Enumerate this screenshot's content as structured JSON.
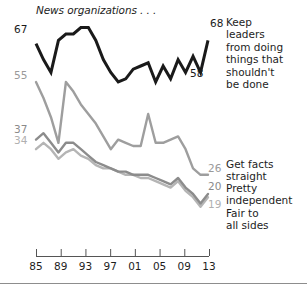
{
  "title": "News organizations . . .",
  "colors": {
    "keep_leaders": "#1a1a1a",
    "get_facts_straight": "#9e9e9e",
    "pretty_independent": "#8c8c8c",
    "fair_to_all_sides": "#b5b5b5",
    "axis": "#555555",
    "rule": "#8d8d8d",
    "background": "#ffffff"
  },
  "left_labels": [
    {
      "text": "67",
      "tone": "black"
    },
    {
      "text": "55",
      "tone": "mid"
    },
    {
      "text": "37",
      "tone": "dark"
    },
    {
      "text": "34",
      "tone": "light"
    }
  ],
  "inline_labels": [
    {
      "text": "68",
      "tone": "black"
    },
    {
      "text": "58",
      "tone": "black"
    },
    {
      "text": "26",
      "tone": "mid"
    },
    {
      "text": "20",
      "tone": "dark"
    },
    {
      "text": "19",
      "tone": "light"
    }
  ],
  "captions": {
    "keep_leaders": "Keep\nleaders\nfrom doing\nthings that\nshouldn't\nbe done",
    "get_facts_straight": "Get facts\nstraight",
    "pretty_independent": "Pretty\nindependent",
    "fair_to_all_sides": "Fair to\nall sides"
  },
  "axis": {
    "ticks": [
      "85",
      "89",
      "93",
      "97",
      "01",
      "05",
      "09",
      "13"
    ]
  },
  "chart_data": {
    "type": "line",
    "title": "News organizations . . .",
    "xlabel": "",
    "ylabel": "",
    "xlim": [
      1985,
      2013
    ],
    "ylim": [
      15,
      75
    ],
    "grid": false,
    "legend": "right-inline",
    "x": [
      1985,
      1986,
      1987,
      1988,
      1989,
      1990,
      1992,
      1993,
      1994,
      1996,
      1997,
      1998,
      1999,
      2000,
      2001,
      2002,
      2003,
      2004,
      2005,
      2007,
      2009,
      2011,
      2012,
      2013
    ],
    "series": [
      {
        "name": "Keep leaders from doing things that shouldn't be done",
        "color": "#1a1a1a",
        "start_value": 67,
        "end_value": 68,
        "annotated_values": [
          67,
          58,
          68
        ],
        "values": [
          67,
          62,
          58,
          68,
          70,
          70,
          72,
          72,
          68,
          62,
          58,
          55,
          56,
          59,
          60,
          61,
          55,
          60,
          56,
          62,
          58,
          63,
          58,
          68
        ]
      },
      {
        "name": "Get facts straight",
        "color": "#9e9e9e",
        "start_value": 55,
        "end_value": 26,
        "annotated_values": [
          55,
          26
        ],
        "values": [
          55,
          50,
          44,
          36,
          55,
          52,
          48,
          45,
          42,
          38,
          34,
          37,
          36,
          35,
          35,
          45,
          36,
          36,
          37,
          38,
          34,
          28,
          26,
          26
        ]
      },
      {
        "name": "Pretty independent",
        "color": "#8c8c8c",
        "start_value": 37,
        "end_value": 20,
        "annotated_values": [
          37,
          20
        ],
        "values": [
          37,
          39,
          36,
          33,
          36,
          36,
          34,
          32,
          30,
          29,
          28,
          27,
          27,
          26,
          26,
          26,
          25,
          24,
          23,
          25,
          22,
          20,
          17,
          20
        ]
      },
      {
        "name": "Fair to all sides",
        "color": "#b5b5b5",
        "start_value": 34,
        "end_value": 19,
        "annotated_values": [
          34,
          19
        ],
        "values": [
          34,
          36,
          34,
          31,
          33,
          34,
          32,
          31,
          29,
          28,
          28,
          27,
          26,
          26,
          25,
          25,
          24,
          23,
          22,
          24,
          21,
          19,
          16,
          19
        ]
      }
    ]
  }
}
